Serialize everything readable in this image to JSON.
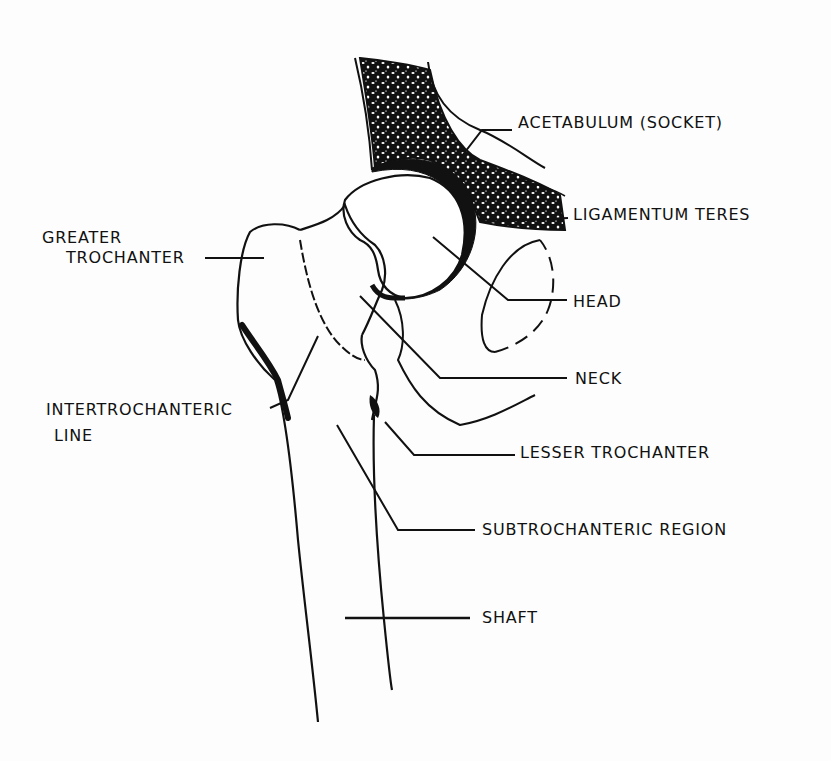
{
  "diagram": {
    "colors": {
      "ink": "#111111",
      "paper": "#fdfdfd"
    },
    "labels": {
      "acetabulum": "ACETABULUM (SOCKET)",
      "ligamentum_teres": "LIGAMENTUM TERES",
      "greater_trochanter_line1": "GREATER",
      "greater_trochanter_line2": "TROCHANTER",
      "head": "HEAD",
      "neck": "NECK",
      "intertrochanteric_line1": "INTERTROCHANTERIC",
      "intertrochanteric_line2": "LINE",
      "lesser_trochanter": "LESSER TROCHANTER",
      "subtrochanteric_region": "SUBTROCHANTERIC REGION",
      "shaft": "SHAFT"
    }
  }
}
